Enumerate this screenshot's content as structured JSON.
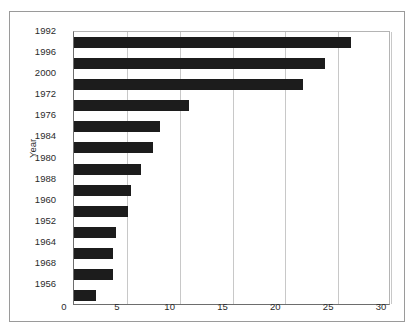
{
  "chart_data": {
    "type": "bar",
    "orientation": "horizontal",
    "title": "",
    "subtitle": "",
    "xlabel": "",
    "ylabel": "Year",
    "categories": [
      "1992",
      "1996",
      "2000",
      "1972",
      "1976",
      "1984",
      "1980",
      "1988",
      "1960",
      "1952",
      "1964",
      "1968",
      "1956"
    ],
    "values": [
      26.2,
      23.8,
      21.7,
      10.9,
      8.1,
      7.5,
      6.3,
      5.4,
      5.1,
      4.0,
      3.7,
      3.7,
      2.1
    ],
    "xlim": [
      0,
      30
    ],
    "xticks": [
      0,
      5,
      10,
      15,
      20,
      25,
      30
    ],
    "xtick_labels": [
      "0",
      "5",
      "10",
      "15",
      "20",
      "25",
      "30"
    ],
    "grid": "vertical",
    "legend": null,
    "bar_color": "#1c1c1c",
    "gridline_color": "#c8c8c8",
    "axis_color": "#6d6d6d",
    "background_color": "#ffffff"
  }
}
